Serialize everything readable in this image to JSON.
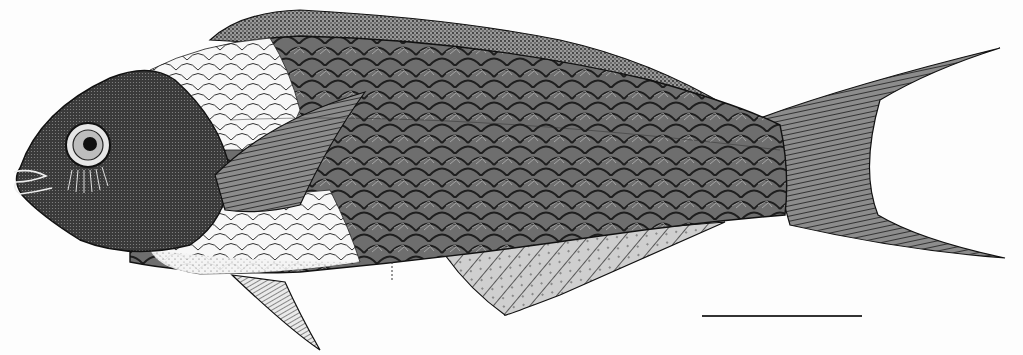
{
  "figure": {
    "style": "pen-and-ink stipple",
    "background": "#fdfdfd",
    "ink": "#1a1a1a",
    "scale_bar": {
      "x1": 702,
      "x2": 862,
      "y": 316,
      "label": ""
    }
  },
  "labels": {
    "caption": ""
  }
}
